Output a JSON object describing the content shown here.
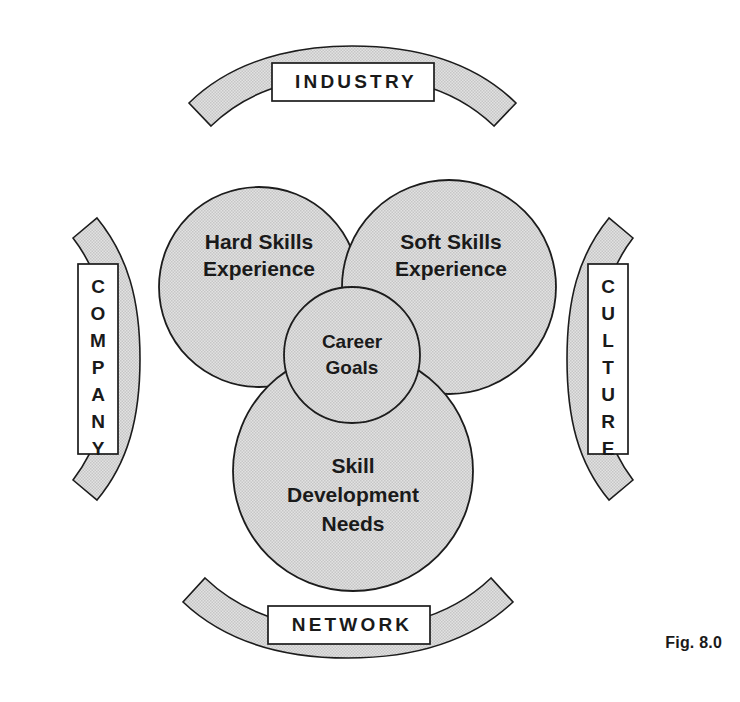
{
  "figure": {
    "caption": "Fig. 8.0",
    "outer_bands": [
      {
        "id": "industry",
        "label": "INDUSTRY",
        "position": "top",
        "orientation": "horizontal"
      },
      {
        "id": "company",
        "label": "COMPANY",
        "position": "left",
        "orientation": "vertical"
      },
      {
        "id": "culture",
        "label": "CULTURE",
        "position": "right",
        "orientation": "vertical"
      },
      {
        "id": "network",
        "label": "NETWORK",
        "position": "bottom",
        "orientation": "horizontal"
      }
    ],
    "circles": [
      {
        "id": "hard-skills",
        "lines": [
          "Hard Skills",
          "Experience"
        ],
        "position": "top-left"
      },
      {
        "id": "soft-skills",
        "lines": [
          "Soft Skills",
          "Experience"
        ],
        "position": "top-right"
      },
      {
        "id": "skill-development",
        "lines": [
          "Skill",
          "Development",
          "Needs"
        ],
        "position": "bottom-center"
      },
      {
        "id": "career-goals",
        "lines": [
          "Career",
          "Goals"
        ],
        "position": "center"
      }
    ],
    "colors": {
      "fill": "#d9d9d9",
      "stroke": "#1c1c1c",
      "text": "#1a1a1a",
      "background": "#ffffff",
      "label_box_fill": "#ffffff"
    },
    "letters": {
      "company": [
        "C",
        "O",
        "M",
        "P",
        "A",
        "N",
        "Y"
      ],
      "culture": [
        "C",
        "U",
        "L",
        "T",
        "U",
        "R",
        "E"
      ]
    }
  }
}
